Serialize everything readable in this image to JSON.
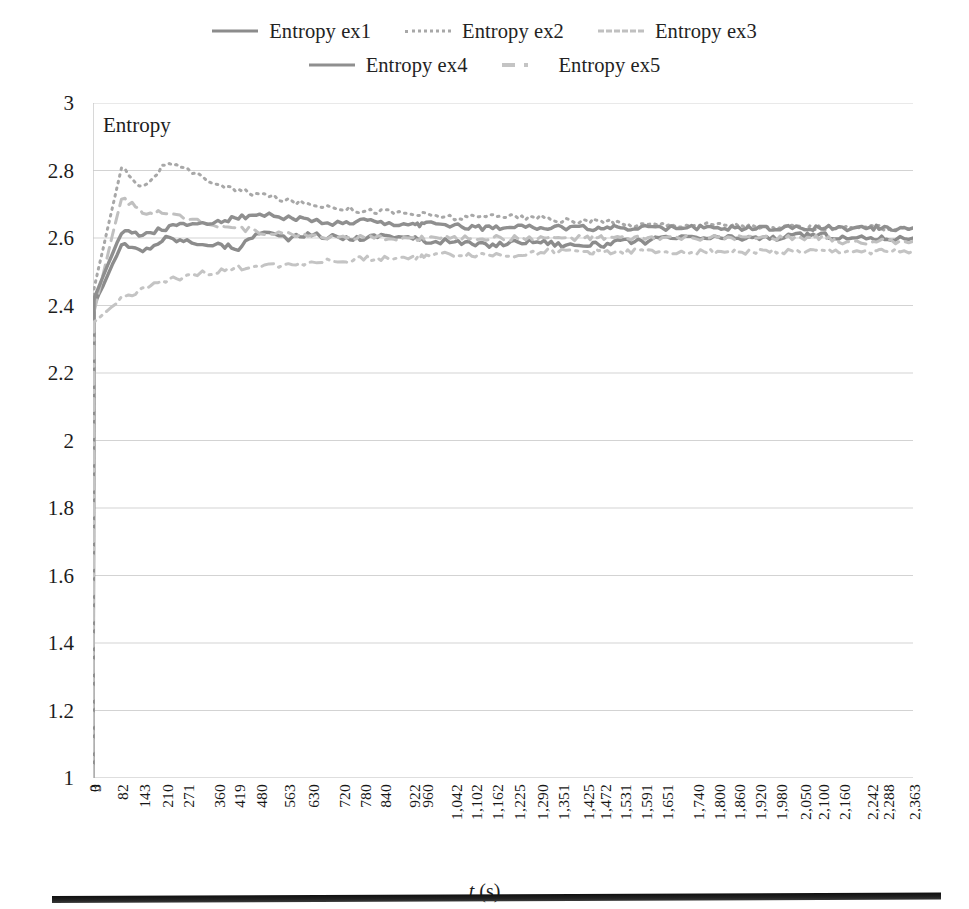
{
  "legend": {
    "rows": [
      [
        {
          "label": "Entropy ex1",
          "style": "solid",
          "swatch": "sw-solid1"
        },
        {
          "label": "Entropy ex2",
          "style": "dotted",
          "swatch": "sw-dot2"
        },
        {
          "label": "Entropy ex3",
          "style": "dashed",
          "swatch": "sw-dash3"
        }
      ],
      [
        {
          "label": "Entropy ex4",
          "style": "solid",
          "swatch": "sw-solid4"
        },
        {
          "label": "Entropy ex5",
          "style": "dash-dot",
          "swatch": "sw-dashdot5"
        }
      ]
    ]
  },
  "plot": {
    "inner_label": "Entropy",
    "xtitle_italic": "t",
    "xtitle_rest": " (s)"
  },
  "chart_data": {
    "type": "line",
    "title": "",
    "xlabel": "t (s)",
    "ylabel": "Entropy",
    "ylim": [
      1,
      3
    ],
    "ytick_labels": [
      "3",
      "2.8",
      "2.6",
      "2.4",
      "2.2",
      "2",
      "1.8",
      "1.6",
      "1.4",
      "1.2",
      "1"
    ],
    "yticks": [
      3,
      2.8,
      2.6,
      2.4,
      2.2,
      2,
      1.8,
      1.6,
      1.4,
      1.2,
      1
    ],
    "grid": true,
    "legend_position": "top",
    "xtick_labels": [
      "0",
      "3",
      "82",
      "143",
      "210",
      "271",
      "360",
      "419",
      "480",
      "563",
      "630",
      "720",
      "780",
      "840",
      "922",
      "960",
      "1,042",
      "1,102",
      "1,162",
      "1,225",
      "1,290",
      "1,351",
      "1,425",
      "1,472",
      "1,531",
      "1,591",
      "1,651",
      "1,740",
      "1,800",
      "1,860",
      "1,920",
      "1,980",
      "2,050",
      "2,100",
      "2,160",
      "2,242",
      "2,288",
      "2,363"
    ],
    "x": [
      0,
      3,
      82,
      143,
      210,
      271,
      360,
      419,
      480,
      563,
      630,
      720,
      780,
      840,
      922,
      960,
      1042,
      1102,
      1162,
      1225,
      1290,
      1351,
      1425,
      1472,
      1531,
      1591,
      1651,
      1740,
      1800,
      1860,
      1920,
      1980,
      2050,
      2100,
      2160,
      2242,
      2288,
      2363
    ],
    "series": [
      {
        "name": "Entropy ex1",
        "style": "solid",
        "color": "#8c8c8c",
        "values": [
          1.0,
          2.4,
          2.58,
          2.56,
          2.6,
          2.59,
          2.58,
          2.57,
          2.62,
          2.6,
          2.61,
          2.6,
          2.6,
          2.61,
          2.6,
          2.59,
          2.59,
          2.58,
          2.58,
          2.59,
          2.59,
          2.58,
          2.58,
          2.58,
          2.59,
          2.59,
          2.6,
          2.6,
          2.6,
          2.6,
          2.6,
          2.6,
          2.61,
          2.61,
          2.6,
          2.6,
          2.6,
          2.6
        ]
      },
      {
        "name": "Entropy ex2",
        "style": "dotted",
        "color": "#a8a8a8",
        "values": [
          1.0,
          2.45,
          2.81,
          2.75,
          2.82,
          2.8,
          2.76,
          2.74,
          2.73,
          2.71,
          2.7,
          2.69,
          2.68,
          2.68,
          2.67,
          2.67,
          2.66,
          2.66,
          2.67,
          2.66,
          2.66,
          2.65,
          2.65,
          2.65,
          2.64,
          2.64,
          2.64,
          2.64,
          2.64,
          2.64,
          2.63,
          2.63,
          2.63,
          2.63,
          2.63,
          2.63,
          2.63,
          2.63
        ]
      },
      {
        "name": "Entropy ex3",
        "style": "dashed",
        "color": "#c0c0c0",
        "values": [
          1.0,
          2.38,
          2.72,
          2.68,
          2.67,
          2.66,
          2.64,
          2.63,
          2.62,
          2.61,
          2.61,
          2.6,
          2.6,
          2.6,
          2.6,
          2.6,
          2.6,
          2.6,
          2.6,
          2.6,
          2.6,
          2.6,
          2.6,
          2.6,
          2.6,
          2.6,
          2.6,
          2.6,
          2.6,
          2.6,
          2.6,
          2.6,
          2.6,
          2.6,
          2.59,
          2.59,
          2.59,
          2.59
        ]
      },
      {
        "name": "Entropy ex4",
        "style": "solid",
        "color": "#8f8f8f",
        "values": [
          1.0,
          2.42,
          2.62,
          2.61,
          2.63,
          2.64,
          2.65,
          2.66,
          2.67,
          2.66,
          2.65,
          2.64,
          2.65,
          2.64,
          2.64,
          2.64,
          2.64,
          2.63,
          2.63,
          2.64,
          2.63,
          2.63,
          2.63,
          2.63,
          2.63,
          2.63,
          2.63,
          2.63,
          2.63,
          2.63,
          2.63,
          2.63,
          2.63,
          2.63,
          2.63,
          2.63,
          2.63,
          2.63
        ]
      },
      {
        "name": "Entropy ex5",
        "style": "dash-dot",
        "color": "#c4c4c4",
        "values": [
          1.0,
          2.35,
          2.42,
          2.45,
          2.47,
          2.49,
          2.5,
          2.51,
          2.52,
          2.52,
          2.53,
          2.53,
          2.54,
          2.54,
          2.54,
          2.55,
          2.55,
          2.55,
          2.55,
          2.55,
          2.56,
          2.56,
          2.56,
          2.56,
          2.56,
          2.56,
          2.56,
          2.56,
          2.56,
          2.56,
          2.56,
          2.56,
          2.56,
          2.56,
          2.56,
          2.56,
          2.56,
          2.56
        ]
      }
    ]
  }
}
